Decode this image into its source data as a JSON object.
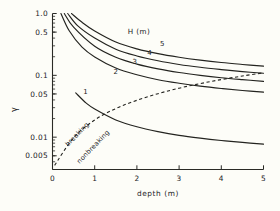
{
  "chart_data": {
    "type": "line",
    "title": "",
    "subtitle": "",
    "xlabel": "depth (m)",
    "ylabel": "γ",
    "xlim": [
      0,
      5
    ],
    "ylim": [
      0.003,
      1.0
    ],
    "yscale": "log",
    "xscale": "linear",
    "grid": false,
    "legend_position": "upper-right-inside",
    "legend_title": "H (m)",
    "xticks": [
      0,
      1,
      2,
      3,
      4,
      5
    ],
    "xticklabels": [
      "0",
      "1",
      "2",
      "3",
      "4",
      "5"
    ],
    "yticks": [
      1.0,
      0.5,
      0.1,
      0.05,
      0.01,
      0.005
    ],
    "yticklabels": [
      "1.0",
      "0.5",
      "0.1",
      "0.05",
      "0.01",
      "0.005"
    ],
    "series": [
      {
        "name": "5",
        "label": "5",
        "style": "solid",
        "x": [
          0.45,
          0.7,
          1.0,
          1.5,
          2.0,
          2.5,
          3.0,
          3.5,
          4.0,
          4.5,
          5.0
        ],
        "y": [
          1.0,
          0.72,
          0.52,
          0.345,
          0.268,
          0.224,
          0.196,
          0.176,
          0.161,
          0.15,
          0.141
        ]
      },
      {
        "name": "4",
        "label": "4",
        "style": "solid",
        "x": [
          0.36,
          0.6,
          1.0,
          1.5,
          2.0,
          2.5,
          3.0,
          3.5,
          4.0,
          4.5,
          5.0
        ],
        "y": [
          1.0,
          0.63,
          0.4,
          0.265,
          0.206,
          0.172,
          0.15,
          0.135,
          0.124,
          0.115,
          0.108
        ]
      },
      {
        "name": "3",
        "label": "3",
        "style": "solid",
        "x": [
          0.28,
          0.5,
          1.0,
          1.5,
          2.0,
          2.5,
          3.0,
          3.5,
          4.0,
          4.5,
          5.0
        ],
        "y": [
          1.0,
          0.6,
          0.295,
          0.196,
          0.152,
          0.127,
          0.111,
          0.1,
          0.0915,
          0.0852,
          0.08
        ]
      },
      {
        "name": "2",
        "label": "2",
        "style": "solid",
        "x": [
          0.2,
          0.4,
          0.7,
          1.0,
          1.5,
          2.0,
          2.5,
          3.0,
          3.5,
          4.0,
          4.5,
          5.0
        ],
        "y": [
          1.0,
          0.52,
          0.285,
          0.198,
          0.131,
          0.102,
          0.085,
          0.0745,
          0.0668,
          0.0612,
          0.0569,
          0.0534
        ]
      },
      {
        "name": "1",
        "label": "1",
        "style": "solid",
        "x": [
          0.55,
          0.8,
          1.0,
          1.5,
          2.0,
          2.5,
          3.0,
          3.5,
          4.0,
          4.5,
          5.0
        ],
        "y": [
          0.052,
          0.0355,
          0.0285,
          0.019,
          0.0147,
          0.0123,
          0.0107,
          0.00965,
          0.00885,
          0.00822,
          0.00772
        ]
      },
      {
        "name": "breaking-limit",
        "label": "",
        "style": "dashed",
        "x": [
          0.05,
          0.5,
          1.0,
          1.5,
          2.0,
          2.5,
          3.0,
          3.5,
          4.0,
          4.5,
          5.0
        ],
        "y": [
          0.0035,
          0.0098,
          0.019,
          0.029,
          0.0395,
          0.0505,
          0.062,
          0.0735,
          0.0855,
          0.0975,
          0.11
        ]
      }
    ],
    "annotations": [
      {
        "text": "H (m)",
        "role": "legend-title",
        "x": 2.05,
        "y": 0.46
      },
      {
        "text": "5",
        "role": "curve-label",
        "x": 2.6,
        "y": 0.295
      },
      {
        "text": "4",
        "role": "curve-label",
        "x": 2.3,
        "y": 0.215
      },
      {
        "text": "3",
        "role": "curve-label",
        "x": 1.95,
        "y": 0.15
      },
      {
        "text": "2",
        "role": "curve-label",
        "x": 1.5,
        "y": 0.104
      },
      {
        "text": "1",
        "role": "curve-label",
        "x": 0.78,
        "y": 0.05
      },
      {
        "text": "breaking",
        "role": "region-label",
        "x": 0.62,
        "y": 0.0105,
        "rotation": -46
      },
      {
        "text": "nonbreaking",
        "role": "region-label",
        "x": 1.0,
        "y": 0.0066,
        "rotation": -46
      }
    ]
  },
  "axes": {
    "x_title": "depth (m)",
    "y_title": "γ"
  }
}
